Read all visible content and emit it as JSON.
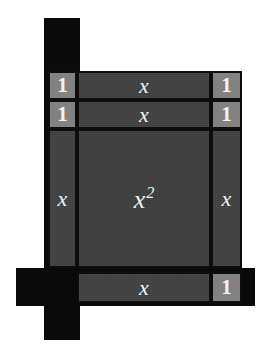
{
  "figure": {
    "kind": "algebra-tiles-area-model",
    "width": 280,
    "height": 347,
    "background": "#ffffff"
  },
  "colors": {
    "frame_black": "#0a0a0a",
    "x_squared_fill": "#3c3c3c",
    "x_fill": "#3f3f3f",
    "unit_fill": "#828282",
    "tile_border": "#0d0d0d",
    "label_text": "#f2f2f2"
  },
  "labels": {
    "x_squared_base": "x",
    "x_squared_exponent": "2",
    "x": "x",
    "one": "1"
  },
  "tiles": [
    {
      "name": "unit-tile-top-left-row1",
      "label": "1",
      "type": "one"
    },
    {
      "name": "unit-tile-top-left-row2",
      "label": "1",
      "type": "one"
    },
    {
      "name": "unit-tile-top-right-row1",
      "label": "1",
      "type": "one"
    },
    {
      "name": "unit-tile-top-right-row2",
      "label": "1",
      "type": "one"
    },
    {
      "name": "x-tile-top-row1",
      "label": "x",
      "type": "x"
    },
    {
      "name": "x-tile-top-row2",
      "label": "x",
      "type": "x"
    },
    {
      "name": "x-tile-left-column",
      "label": "x",
      "type": "x"
    },
    {
      "name": "x-tile-right-column",
      "label": "x",
      "type": "x"
    },
    {
      "name": "x-squared-tile",
      "label": "x2",
      "type": "x-squared"
    },
    {
      "name": "x-tile-bottom-row",
      "label": "x",
      "type": "x"
    },
    {
      "name": "unit-tile-bottom-right",
      "label": "1",
      "type": "one"
    }
  ]
}
